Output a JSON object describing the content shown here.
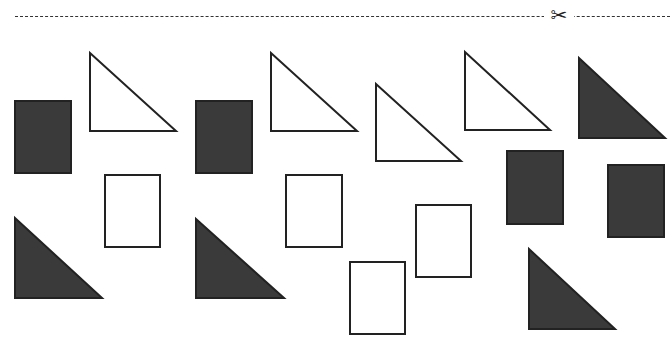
{
  "page": {
    "type": "cut-out worksheet",
    "cut_line": {
      "style": "dashed",
      "icon": "scissors-icon",
      "glyph": "✂"
    }
  },
  "colors": {
    "dark_fill": "#3a3a3a",
    "outline": "#222222",
    "background": "#ffffff"
  },
  "shapes": {
    "rectangles": [
      {
        "id": "r1",
        "fill": "dark",
        "x": 15,
        "y": 101,
        "w": 56,
        "h": 72
      },
      {
        "id": "r2",
        "fill": "outline",
        "x": 105,
        "y": 175,
        "w": 55,
        "h": 72
      },
      {
        "id": "r3",
        "fill": "dark",
        "x": 196,
        "y": 101,
        "w": 56,
        "h": 72
      },
      {
        "id": "r4",
        "fill": "outline",
        "x": 286,
        "y": 175,
        "w": 56,
        "h": 72
      },
      {
        "id": "r5",
        "fill": "outline",
        "x": 350,
        "y": 262,
        "w": 55,
        "h": 72
      },
      {
        "id": "r6",
        "fill": "outline",
        "x": 416,
        "y": 205,
        "w": 55,
        "h": 72
      },
      {
        "id": "r7",
        "fill": "dark",
        "x": 507,
        "y": 151,
        "w": 56,
        "h": 73
      },
      {
        "id": "r8",
        "fill": "dark",
        "x": 608,
        "y": 165,
        "w": 56,
        "h": 72
      }
    ],
    "triangles": [
      {
        "id": "t1",
        "fill": "outline",
        "points": "90,53 90,131 176,131"
      },
      {
        "id": "t2",
        "fill": "dark",
        "points": "15,218 15,298 102,298"
      },
      {
        "id": "t3",
        "fill": "outline",
        "points": "271,53 271,131 357,131"
      },
      {
        "id": "t4",
        "fill": "dark",
        "points": "196,219 196,298 284,298"
      },
      {
        "id": "t5",
        "fill": "outline",
        "points": "376,84 376,161 461,161"
      },
      {
        "id": "t6",
        "fill": "outline",
        "points": "465,52 465,130 550,130"
      },
      {
        "id": "t7",
        "fill": "dark",
        "points": "579,58 579,138 665,138"
      },
      {
        "id": "t8",
        "fill": "dark",
        "points": "529,249 529,329 615,329"
      }
    ]
  }
}
